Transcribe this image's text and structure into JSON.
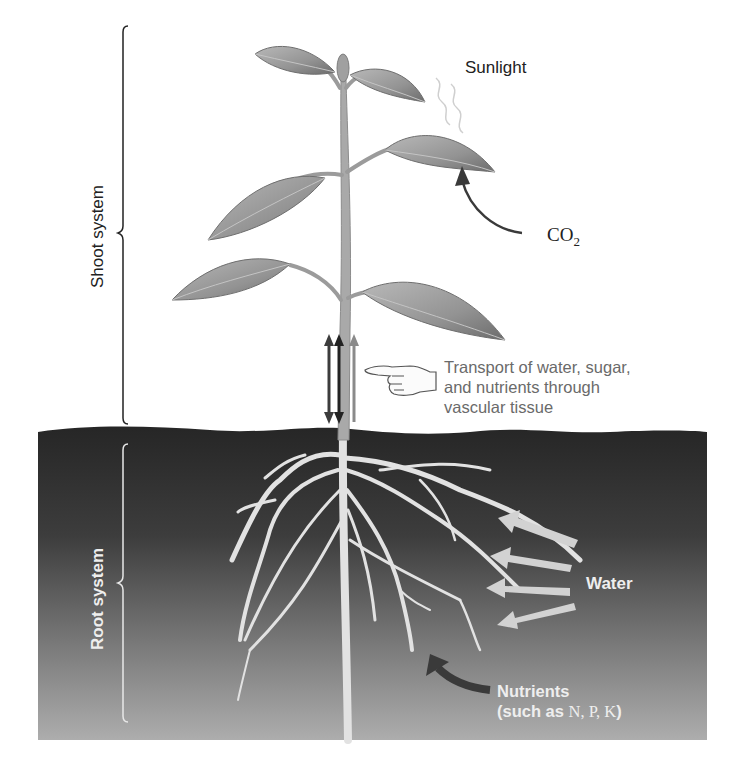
{
  "diagram": {
    "labels": {
      "sunlight": "Sunlight",
      "co2_main": "CO",
      "co2_sub": "2",
      "transport_line1": "Transport of water, sugar,",
      "transport_line2": "and nutrients through",
      "transport_line3": "vascular tissue",
      "water": "Water",
      "nutrients_line1": "Nutrients",
      "nutrients_prefix": "(such as ",
      "nutrients_elements": "N, P, K",
      "nutrients_suffix": ")",
      "shoot_system": "Shoot system",
      "root_system": "Root system"
    },
    "icons": {
      "pointing_hand": "pointing-hand-icon",
      "vascular_arrows": "bidirectional-arrows",
      "co2_arrow": "curved-arrow",
      "water_arrows": "water-inflow-arrows",
      "nutrient_arrow": "curved-arrow"
    },
    "colors": {
      "soil_top": "#2a2a2a",
      "soil_bottom": "#a9a9a9",
      "leaf": "#9a9a9a",
      "stem": "#a8a8a8",
      "root": "#e4e4e4",
      "arrow_dark": "#3a3a3a",
      "arrow_light": "#cfcfcf",
      "text_dark": "#222222",
      "text_gray": "#6a6a6a"
    }
  }
}
